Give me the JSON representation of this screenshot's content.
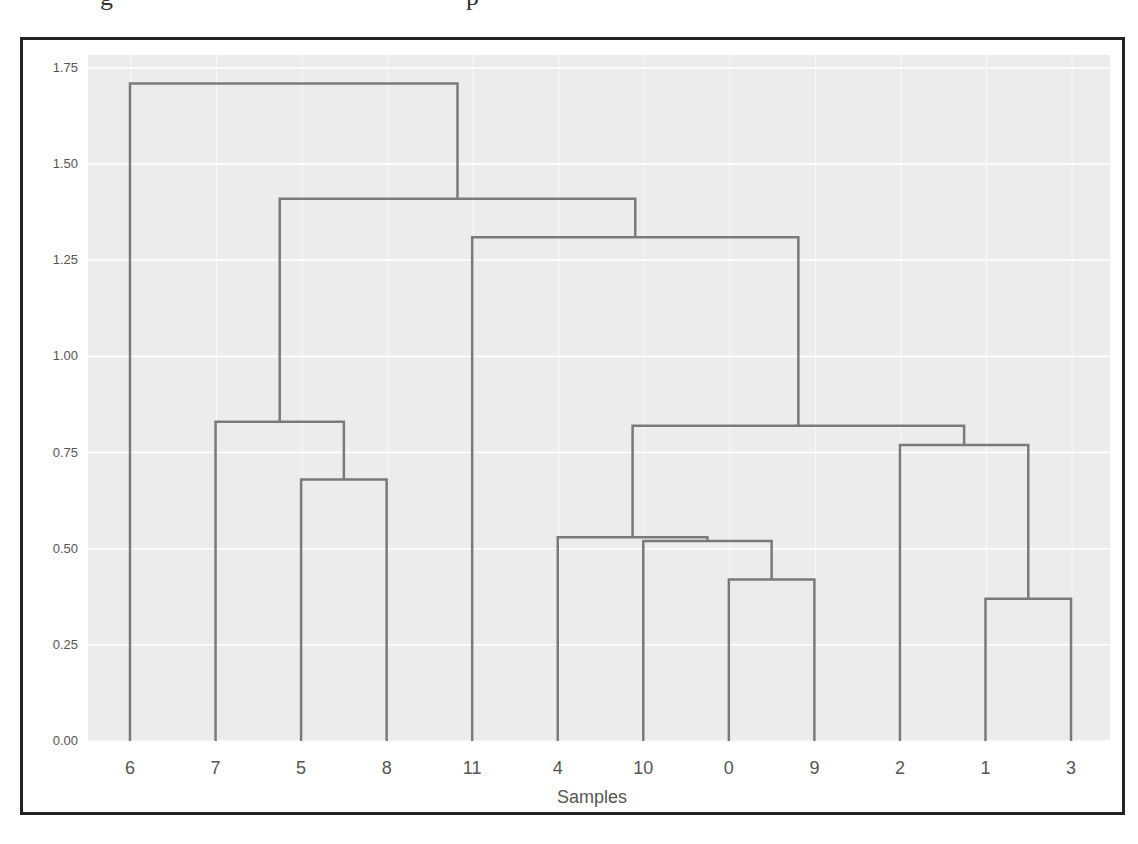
{
  "header": {
    "cut_off_fragments": [
      "g",
      "p"
    ]
  },
  "chart_data": {
    "type": "dendrogram",
    "title": "",
    "xlabel": "Samples",
    "ylabel": "",
    "ylim": [
      0,
      1.75
    ],
    "yticks": [
      "0.00",
      "0.25",
      "0.50",
      "0.75",
      "1.00",
      "1.25",
      "1.50",
      "1.75"
    ],
    "grid": true,
    "leaf_order": [
      "6",
      "7",
      "5",
      "8",
      "11",
      "4",
      "10",
      "0",
      "9",
      "2",
      "1",
      "3"
    ],
    "merges": [
      {
        "left": "1",
        "right": "3",
        "height": 0.37
      },
      {
        "left": "0",
        "right": "9",
        "height": 0.42
      },
      {
        "left": "10",
        "right": "(0,9)",
        "height": 0.52
      },
      {
        "left": "4",
        "right": "(10,(0,9))",
        "height": 0.53
      },
      {
        "left": "5",
        "right": "8",
        "height": 0.68
      },
      {
        "left": "2",
        "right": "(1,3)",
        "height": 0.77
      },
      {
        "left": "(4,(10,(0,9)))",
        "right": "(2,(1,3))",
        "height": 0.82
      },
      {
        "left": "7",
        "right": "(5,8)",
        "height": 0.83
      },
      {
        "left": "11",
        "right": "((4,...),(2,...))",
        "height": 1.31
      },
      {
        "left": "(7,(5,8))",
        "right": "(11,...)",
        "height": 1.41
      },
      {
        "left": "6",
        "right": "rest",
        "height": 1.71
      }
    ],
    "colors": {
      "background": "#ececec",
      "grid": "#ffffff",
      "link": "#7a7a7a"
    }
  }
}
